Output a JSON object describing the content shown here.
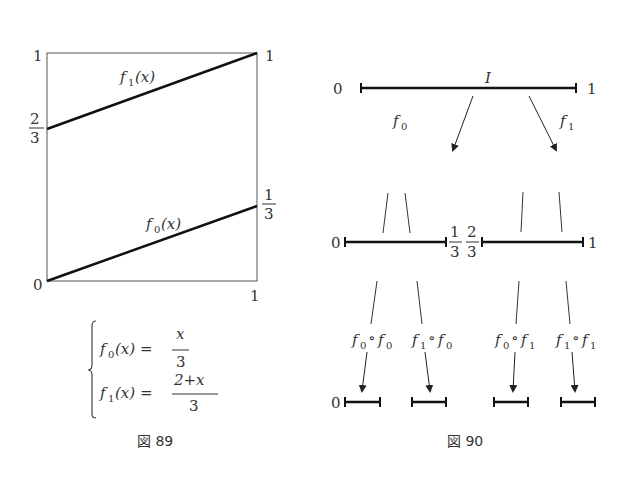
{
  "figure89": {
    "caption": "図 89",
    "y_top_label": "1",
    "y_mid_label_num": "2",
    "y_mid_label_den": "3",
    "y_bottom_label": "0",
    "x_right_label": "1",
    "right_top_label": "1",
    "right_mid_label_num": "1",
    "right_mid_label_den": "3",
    "f1_label": "f",
    "f1_sub": "1",
    "f0_label": "f",
    "f0_sub": "0",
    "arg": "(x)",
    "eq0_lhs": "f",
    "eq0_sub": "0",
    "eq0_arg": "(x) =",
    "eq0_num": "x",
    "eq0_den": "3",
    "eq1_lhs": "f",
    "eq1_sub": "1",
    "eq1_arg": "(x) =",
    "eq1_num": "2+x",
    "eq1_den": "3"
  },
  "figure90": {
    "caption": "図 90",
    "top_left": "0",
    "top_right": "1",
    "interval_label": "I",
    "f0_label": "f",
    "f0_sub": "0",
    "f1_label": "f",
    "f1_sub": "1",
    "mid_left": "0",
    "mid_right": "1",
    "one_third_num": "1",
    "one_third_den": "3",
    "two_third_num": "2",
    "two_third_den": "3",
    "bottom_left": "0",
    "compositions": [
      {
        "a": "f",
        "a_sub": "0",
        "op": "∘",
        "b": "f",
        "b_sub": "0"
      },
      {
        "a": "f",
        "a_sub": "1",
        "op": "∘",
        "b": "f",
        "b_sub": "0"
      },
      {
        "a": "f",
        "a_sub": "0",
        "op": "∘",
        "b": "f",
        "b_sub": "1"
      },
      {
        "a": "f",
        "a_sub": "1",
        "op": "∘",
        "b": "f",
        "b_sub": "1"
      }
    ]
  }
}
